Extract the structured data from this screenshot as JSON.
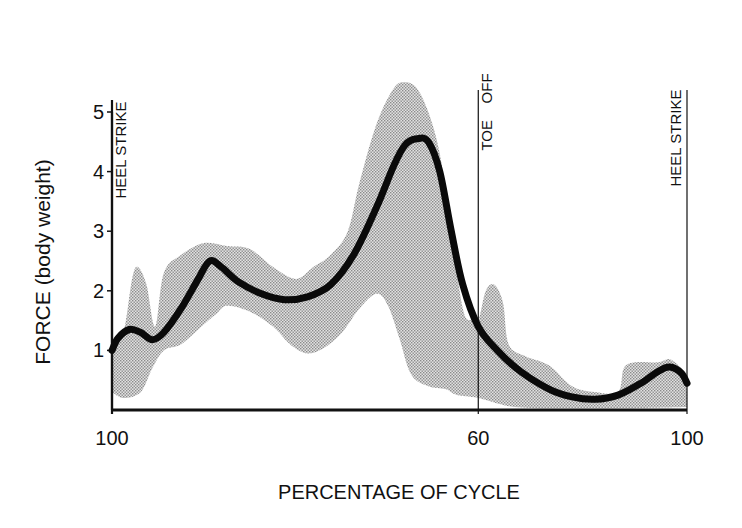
{
  "chart_data": {
    "type": "line",
    "title": "",
    "xlabel": "PERCENTAGE OF CYCLE",
    "ylabel": "FORCE (body weight)",
    "ylim": [
      0,
      5
    ],
    "yticks": [
      "1",
      "2",
      "3",
      "4",
      "5"
    ],
    "xticks": [
      {
        "label": "100",
        "pos": 0.0
      },
      {
        "label": "60",
        "pos": 0.637
      },
      {
        "label": "100",
        "pos": 1.0
      }
    ],
    "events": [
      {
        "label": "HEEL STRIKE",
        "pos": 0.0
      },
      {
        "label": "TOE    OFF",
        "pos": 0.637
      },
      {
        "label": "HEEL STRIKE",
        "pos": 1.0
      }
    ],
    "grid": false,
    "legend": "none",
    "series": [
      {
        "name": "mean force",
        "style": "thick black line",
        "points": [
          [
            0.0,
            1.0
          ],
          [
            0.01,
            1.2
          ],
          [
            0.03,
            1.35
          ],
          [
            0.05,
            1.3
          ],
          [
            0.07,
            1.18
          ],
          [
            0.09,
            1.3
          ],
          [
            0.12,
            1.7
          ],
          [
            0.15,
            2.2
          ],
          [
            0.17,
            2.5
          ],
          [
            0.19,
            2.4
          ],
          [
            0.22,
            2.15
          ],
          [
            0.26,
            1.95
          ],
          [
            0.3,
            1.85
          ],
          [
            0.34,
            1.9
          ],
          [
            0.38,
            2.1
          ],
          [
            0.42,
            2.6
          ],
          [
            0.46,
            3.4
          ],
          [
            0.49,
            4.1
          ],
          [
            0.51,
            4.45
          ],
          [
            0.53,
            4.55
          ],
          [
            0.55,
            4.5
          ],
          [
            0.57,
            4.0
          ],
          [
            0.59,
            3.0
          ],
          [
            0.61,
            2.1
          ],
          [
            0.637,
            1.4
          ],
          [
            0.67,
            1.0
          ],
          [
            0.71,
            0.65
          ],
          [
            0.76,
            0.35
          ],
          [
            0.8,
            0.22
          ],
          [
            0.84,
            0.18
          ],
          [
            0.88,
            0.25
          ],
          [
            0.92,
            0.45
          ],
          [
            0.95,
            0.65
          ],
          [
            0.97,
            0.72
          ],
          [
            0.99,
            0.62
          ],
          [
            1.0,
            0.45
          ]
        ]
      },
      {
        "name": "range band upper",
        "style": "stippled gray band",
        "points": [
          [
            0.0,
            1.0
          ],
          [
            0.02,
            1.3
          ],
          [
            0.035,
            2.2
          ],
          [
            0.045,
            2.4
          ],
          [
            0.06,
            2.1
          ],
          [
            0.075,
            1.4
          ],
          [
            0.09,
            2.3
          ],
          [
            0.12,
            2.6
          ],
          [
            0.16,
            2.8
          ],
          [
            0.2,
            2.75
          ],
          [
            0.24,
            2.7
          ],
          [
            0.28,
            2.4
          ],
          [
            0.32,
            2.2
          ],
          [
            0.35,
            2.4
          ],
          [
            0.38,
            2.6
          ],
          [
            0.41,
            3.0
          ],
          [
            0.43,
            3.8
          ],
          [
            0.46,
            4.8
          ],
          [
            0.49,
            5.4
          ],
          [
            0.51,
            5.5
          ],
          [
            0.53,
            5.4
          ],
          [
            0.55,
            5.0
          ],
          [
            0.57,
            4.3
          ],
          [
            0.59,
            3.0
          ],
          [
            0.61,
            1.7
          ],
          [
            0.625,
            1.5
          ],
          [
            0.637,
            1.5
          ],
          [
            0.65,
            2.0
          ],
          [
            0.665,
            2.1
          ],
          [
            0.68,
            1.8
          ],
          [
            0.69,
            1.1
          ],
          [
            0.72,
            0.9
          ],
          [
            0.76,
            0.75
          ],
          [
            0.8,
            0.4
          ],
          [
            0.84,
            0.3
          ],
          [
            0.88,
            0.3
          ],
          [
            0.89,
            0.7
          ],
          [
            0.91,
            0.8
          ],
          [
            0.95,
            0.8
          ],
          [
            0.97,
            0.85
          ],
          [
            0.99,
            0.7
          ],
          [
            1.0,
            0.55
          ]
        ]
      },
      {
        "name": "range band lower",
        "style": "stippled gray band",
        "points": [
          [
            0.0,
            0.3
          ],
          [
            0.02,
            0.2
          ],
          [
            0.05,
            0.3
          ],
          [
            0.07,
            0.7
          ],
          [
            0.09,
            1.0
          ],
          [
            0.12,
            1.1
          ],
          [
            0.15,
            1.35
          ],
          [
            0.18,
            1.6
          ],
          [
            0.2,
            1.75
          ],
          [
            0.24,
            1.65
          ],
          [
            0.28,
            1.4
          ],
          [
            0.31,
            1.1
          ],
          [
            0.34,
            0.95
          ],
          [
            0.37,
            1.05
          ],
          [
            0.4,
            1.3
          ],
          [
            0.43,
            1.7
          ],
          [
            0.46,
            1.95
          ],
          [
            0.48,
            1.75
          ],
          [
            0.5,
            1.2
          ],
          [
            0.52,
            0.6
          ],
          [
            0.55,
            0.4
          ],
          [
            0.58,
            0.35
          ],
          [
            0.6,
            0.25
          ],
          [
            0.637,
            0.2
          ],
          [
            0.7,
            0.05
          ],
          [
            0.8,
            0.03
          ],
          [
            0.9,
            0.03
          ],
          [
            1.0,
            0.05
          ]
        ]
      }
    ]
  }
}
